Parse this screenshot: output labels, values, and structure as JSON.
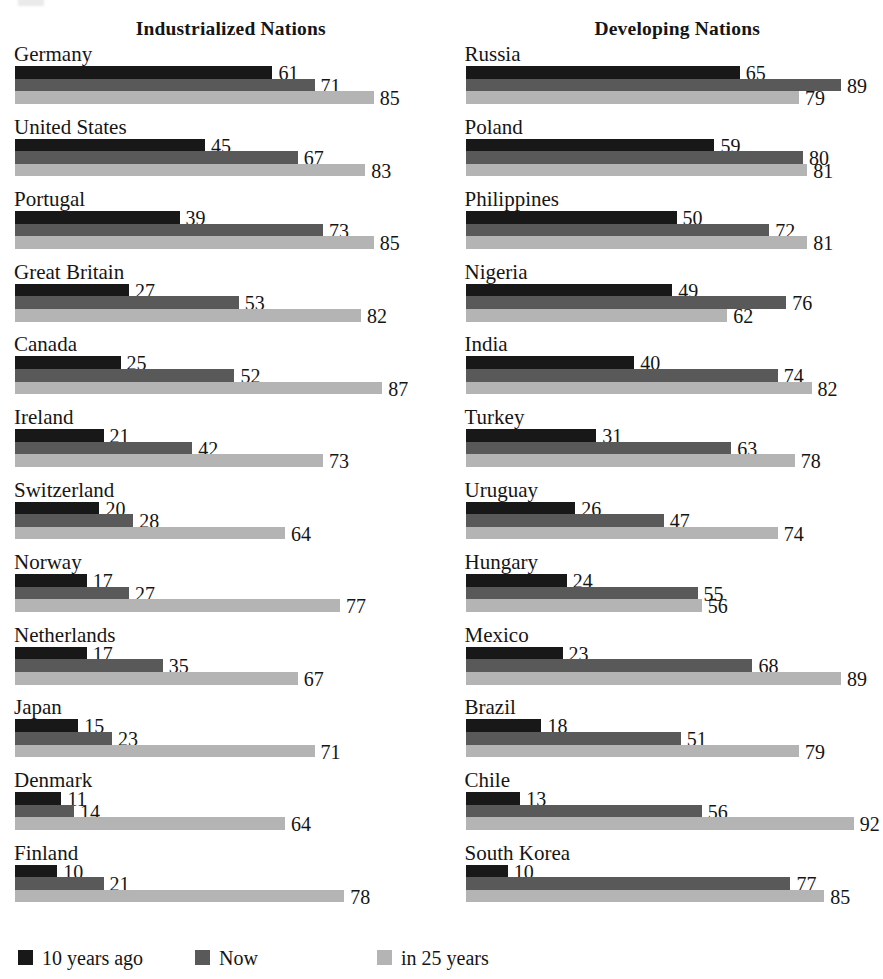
{
  "chart_data": {
    "type": "bar",
    "orientation": "horizontal",
    "title": "",
    "xlabel": "",
    "ylabel": "",
    "xlim": [
      0,
      100
    ],
    "grid": false,
    "legend_position": "bottom",
    "legend": [
      "10 years ago",
      "Now",
      "in 25 years"
    ],
    "series": [
      {
        "name": "10 years ago",
        "color": "#181818"
      },
      {
        "name": "Now",
        "color": "#595959"
      },
      {
        "name": "in 25 years",
        "color": "#b4b4b4"
      }
    ],
    "panels": [
      {
        "title": "Industrialized Nations",
        "categories": [
          "Germany",
          "United States",
          "Portugal",
          "Great Britain",
          "Canada",
          "Ireland",
          "Switzerland",
          "Norway",
          "Netherlands",
          "Japan",
          "Denmark",
          "Finland"
        ],
        "values": {
          "10 years ago": [
            61,
            45,
            39,
            27,
            25,
            21,
            20,
            17,
            17,
            15,
            11,
            10
          ],
          "Now": [
            71,
            67,
            73,
            53,
            52,
            42,
            28,
            27,
            35,
            23,
            14,
            21
          ],
          "in 25 years": [
            85,
            83,
            85,
            82,
            87,
            73,
            64,
            77,
            67,
            71,
            64,
            78
          ]
        }
      },
      {
        "title": "Developing Nations",
        "categories": [
          "Russia",
          "Poland",
          "Philippines",
          "Nigeria",
          "India",
          "Turkey",
          "Uruguay",
          "Hungary",
          "Mexico",
          "Brazil",
          "Chile",
          "South Korea"
        ],
        "values": {
          "10 years ago": [
            65,
            59,
            50,
            49,
            40,
            31,
            26,
            24,
            23,
            18,
            13,
            10
          ],
          "Now": [
            89,
            80,
            72,
            76,
            74,
            63,
            47,
            55,
            68,
            51,
            56,
            77
          ],
          "in 25 years": [
            79,
            81,
            81,
            62,
            82,
            78,
            74,
            56,
            89,
            79,
            92,
            85
          ]
        }
      }
    ]
  },
  "colors": {
    "series_10_years_ago": "#181818",
    "series_now": "#595959",
    "series_in_25_years": "#b4b4b4",
    "background": "#ffffff",
    "text": "#151515"
  }
}
